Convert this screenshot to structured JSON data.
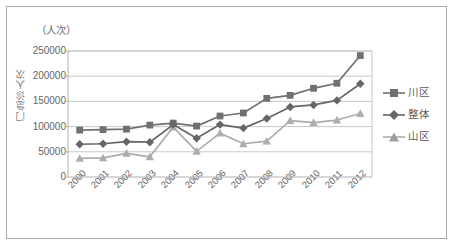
{
  "chart_data": {
    "type": "line",
    "title": "",
    "subtitle": "",
    "unit_label": "（人次）",
    "ylabel": "门急诊人次",
    "xlabel": "",
    "categories": [
      "2000",
      "2001",
      "2002",
      "2003",
      "2004",
      "2005",
      "2006",
      "2007",
      "2008",
      "2009",
      "2010",
      "2011",
      "2012"
    ],
    "ylim": [
      0,
      250000
    ],
    "yticks": [
      0,
      50000,
      100000,
      150000,
      200000,
      250000
    ],
    "ytick_labels": [
      "0",
      "50000",
      "100000",
      "150000",
      "200000",
      "250000"
    ],
    "grid": true,
    "grid_axis": "y",
    "legend_position": "right",
    "series": [
      {
        "name": "川区",
        "marker": "square",
        "color": "#707070",
        "values": [
          93000,
          94000,
          95000,
          103000,
          107000,
          101000,
          121000,
          127000,
          156000,
          162000,
          176000,
          186000,
          241000
        ]
      },
      {
        "name": "整体",
        "marker": "diamond",
        "color": "#666666",
        "values": [
          65000,
          66000,
          70000,
          69000,
          104000,
          77000,
          104000,
          97000,
          116000,
          139000,
          143000,
          152000,
          185000
        ]
      },
      {
        "name": "山区",
        "marker": "triangle",
        "color": "#adadad",
        "values": [
          37000,
          38000,
          47000,
          40000,
          99000,
          51000,
          87000,
          66000,
          71000,
          112000,
          108000,
          113000,
          126000
        ]
      }
    ]
  },
  "colors": {
    "frame_border": "#a9a9a9",
    "gridline": "#c8c8c8",
    "axis_line": "#b0b0b0",
    "tick_text": "#666666",
    "label_text": "#6b6b6b",
    "background": "#ffffff"
  }
}
